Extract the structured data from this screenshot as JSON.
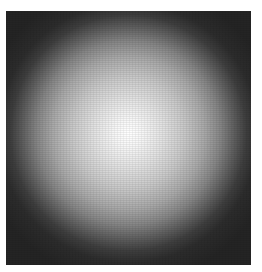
{
  "image": {
    "description": "Grayscale radial intensity blob on dark square",
    "colors": {
      "background": "#ffffff",
      "frame": "#262626",
      "center": "#ffffff",
      "edge": "#242424"
    }
  }
}
